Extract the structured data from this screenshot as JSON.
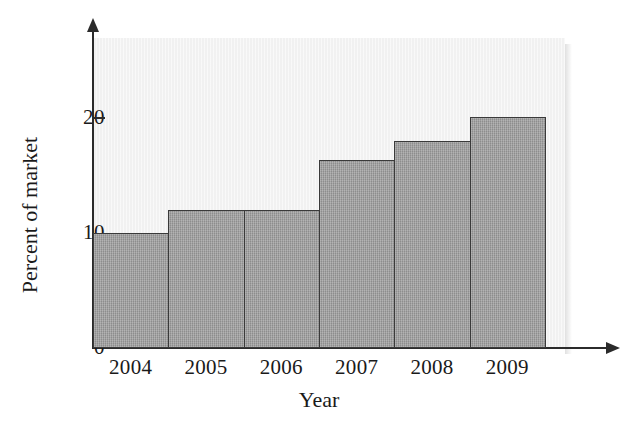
{
  "chart_data": {
    "type": "bar",
    "title": "",
    "subtitle": "",
    "xlabel": "Year",
    "ylabel": "Percent of market",
    "categories": [
      "2004",
      "2005",
      "2006",
      "2007",
      "2008",
      "2009"
    ],
    "values": [
      10.0,
      12.0,
      12.0,
      16.4,
      18.0,
      20.1
    ],
    "series": [
      {
        "name": "Percent of market",
        "values": [
          10.0,
          12.0,
          12.0,
          16.4,
          18.0,
          20.1
        ]
      }
    ],
    "ylim": [
      0,
      27
    ],
    "xlim": [
      0,
      6
    ],
    "ytick_labels": [
      "0",
      "10",
      "20"
    ],
    "ytick_values": [
      0,
      10,
      20
    ],
    "grid": false,
    "legend": false,
    "legend_position": "none",
    "bar_style": "adjacent-histogram",
    "colors": {
      "bar_fill": "#9b9b9b",
      "bar_edge": "#3a3a3a",
      "plot_background": "#f1f1f1",
      "axis": "#2b2b2b",
      "text": "#1a1a1a",
      "figure_background": "#ffffff"
    },
    "annotations": []
  },
  "axes": {
    "y_title": "Percent of market",
    "x_title": "Year",
    "y_ticks": [
      {
        "label": "0",
        "value": 0
      },
      {
        "label": "10",
        "value": 10
      },
      {
        "label": "20",
        "value": 20
      }
    ],
    "x_ticks": [
      {
        "label": "2004"
      },
      {
        "label": "2005"
      },
      {
        "label": "2006"
      },
      {
        "label": "2007"
      },
      {
        "label": "2008"
      },
      {
        "label": "2009"
      }
    ]
  }
}
